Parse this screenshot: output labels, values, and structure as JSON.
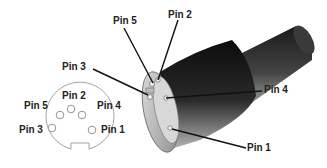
{
  "connector_3d": {
    "labels": {
      "pin5": "Pin 5",
      "pin2": "Pin 2",
      "pin3": "Pin 3",
      "pin4": "Pin 4",
      "pin1": "Pin 1"
    }
  },
  "face_view": {
    "labels": {
      "pin2": "Pin 2",
      "pin5": "Pin 5",
      "pin4": "Pin 4",
      "pin3": "Pin 3",
      "pin1": "Pin 1"
    }
  },
  "colors": {
    "background": "#ffffff",
    "line": "#111111",
    "body_dark": "#1a1a1a",
    "body_mid": "#777777",
    "face_outline": "#888888"
  }
}
